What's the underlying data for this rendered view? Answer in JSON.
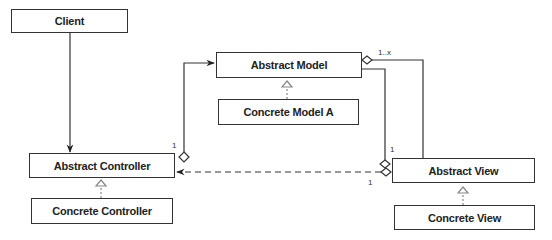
{
  "diagram": {
    "type": "uml-class-diagram",
    "classes": {
      "client": {
        "label": "Client",
        "x": 11,
        "y": 9,
        "w": 117,
        "h": 24
      },
      "abstract_controller": {
        "label": "Abstract Controller",
        "x": 29,
        "y": 153,
        "w": 146,
        "h": 25
      },
      "concrete_controller": {
        "label": "Concrete Controller",
        "x": 31,
        "y": 198,
        "w": 142,
        "h": 26
      },
      "abstract_model": {
        "label": "Abstract Model",
        "x": 216,
        "y": 52,
        "w": 146,
        "h": 26
      },
      "concrete_model_a": {
        "label": "Concrete Model A",
        "x": 218,
        "y": 99,
        "w": 141,
        "h": 26
      },
      "abstract_view": {
        "label": "Abstract View",
        "x": 392,
        "y": 158,
        "w": 143,
        "h": 25
      },
      "concrete_view": {
        "label": "Concrete View",
        "x": 394,
        "y": 205,
        "w": 141,
        "h": 25
      }
    },
    "multiplicities": {
      "controller_model": "1",
      "model_view": "1..x",
      "view_model": "1",
      "view_controller": "1"
    },
    "relationships": [
      {
        "from": "Client",
        "to": "Abstract Controller",
        "kind": "association-arrow"
      },
      {
        "from": "Abstract Controller",
        "to": "Abstract Model",
        "kind": "aggregation-arrow",
        "multiplicity": "1"
      },
      {
        "from": "Abstract Model",
        "to": "Abstract View",
        "kind": "aggregation",
        "multiplicity": "1..x"
      },
      {
        "from": "Abstract View",
        "to": "Abstract Model",
        "kind": "aggregation",
        "multiplicity": "1"
      },
      {
        "from": "Abstract View",
        "to": "Abstract Controller",
        "kind": "dependency-dashed-arrow",
        "multiplicity": "1"
      },
      {
        "from": "Concrete Controller",
        "to": "Abstract Controller",
        "kind": "realization"
      },
      {
        "from": "Concrete Model A",
        "to": "Abstract Model",
        "kind": "realization"
      },
      {
        "from": "Concrete View",
        "to": "Abstract View",
        "kind": "realization"
      }
    ]
  }
}
